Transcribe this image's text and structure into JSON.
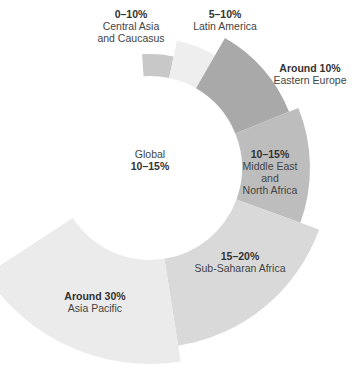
{
  "chart_data": {
    "type": "pie",
    "subtype": "rose-donut",
    "title": "",
    "center_label": {
      "name": "Global",
      "value": "10–15%"
    },
    "center": [
      150,
      168
    ],
    "inner_radius": 92,
    "segments": [
      {
        "name": "Central Asia and Caucasus",
        "name_lines": [
          "Central Asia",
          "and Caucasus"
        ],
        "value": "0–10%",
        "value_est": 5,
        "start_deg": -4,
        "end_deg": 12,
        "outer_radius": 114,
        "color": "#c8c8c8",
        "label_pos": [
          131,
          8
        ]
      },
      {
        "name": "Latin America",
        "name_lines": [
          "Latin America"
        ],
        "value": "5–10%",
        "value_est": 7.5,
        "start_deg": 12,
        "end_deg": 30,
        "outer_radius": 130,
        "color": "#eeeeee",
        "label_pos": [
          225,
          8
        ]
      },
      {
        "name": "Eastern Europe",
        "name_lines": [
          "Eastern Europe"
        ],
        "value": "Around 10%",
        "value_est": 10,
        "start_deg": 30,
        "end_deg": 68,
        "outer_radius": 150,
        "color": "#a9a9a9",
        "label_pos": [
          310,
          62
        ]
      },
      {
        "name": "Middle East and North Africa",
        "name_lines": [
          "Middle East",
          "and",
          "North Africa"
        ],
        "value": "10–15%",
        "value_est": 12.5,
        "start_deg": 68,
        "end_deg": 110,
        "outer_radius": 160,
        "color": "#bdbdbd",
        "label_pos": [
          270,
          148
        ]
      },
      {
        "name": "Sub-Saharan Africa",
        "name_lines": [
          "Sub-Saharan Africa"
        ],
        "value": "15–20%",
        "value_est": 17.5,
        "start_deg": 110,
        "end_deg": 171,
        "outer_radius": 180,
        "color": "#d9d9d9",
        "label_pos": [
          240,
          250
        ]
      },
      {
        "name": "Asia Pacific",
        "name_lines": [
          "Asia Pacific"
        ],
        "value": "Around 30%",
        "value_est": 30,
        "start_deg": 171,
        "end_deg": 237,
        "outer_radius": 196,
        "color": "#ebebeb",
        "label_pos": [
          95,
          290
        ]
      }
    ],
    "legend": "none",
    "grid": false
  }
}
